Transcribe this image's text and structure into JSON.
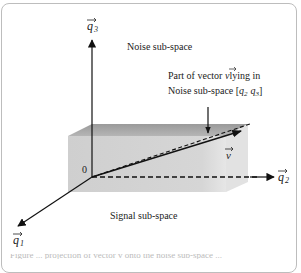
{
  "figure": {
    "type": "vector-subspace-diagram",
    "labels": {
      "axis_q1": "q",
      "axis_q1_sub": "1",
      "axis_q2": "q",
      "axis_q2_sub": "2",
      "axis_q3": "q",
      "axis_q3_sub": "3",
      "origin": "0",
      "vector_v": "v",
      "noise_subspace": "Noise sub-space",
      "signal_subspace": "Signal sub-space",
      "annotation_line1": "Part of vector v lying in",
      "annotation_line2": "Noise sub-space [q2 q3]"
    },
    "annotation": {
      "line1_prefix": "Part of vector ",
      "line1_vec": "v",
      "line1_suffix": "lying in",
      "line2_prefix": "Noise sub-space [",
      "line2_q2": "q",
      "line2_q2_sub": "2",
      "line2_q3": "q",
      "line2_q3_sub": "3",
      "line2_suffix": "]"
    },
    "caption_cut": "Figure ... projection of vector v onto the noise sub-space ..."
  },
  "colors": {
    "box_front": "#d4d4d4",
    "box_top": "#a9a9a9",
    "axis": "#111111",
    "frame": "#bdbdbd"
  }
}
